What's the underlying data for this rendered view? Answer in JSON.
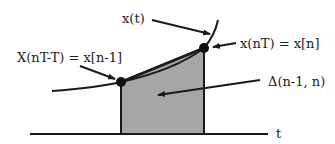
{
  "diagram": {
    "type": "trapezoidal-rule-integration",
    "labels": {
      "curve": "x(t)",
      "left_sample": "X(nT-T) = x[n-1]",
      "right_sample": "x(nT) = x[n]",
      "area": "Δ(n-1, n)",
      "axis": "t"
    },
    "colors": {
      "line": "#1a1a1a",
      "fill": "#a6a6a6",
      "text": "#222222",
      "background": "#ffffff"
    },
    "points": {
      "left_sample": {
        "x": 121,
        "y": 82
      },
      "right_sample": {
        "x": 204,
        "y": 48
      }
    },
    "axis": {
      "y": 134,
      "x_start": 30,
      "x_end": 268
    }
  }
}
